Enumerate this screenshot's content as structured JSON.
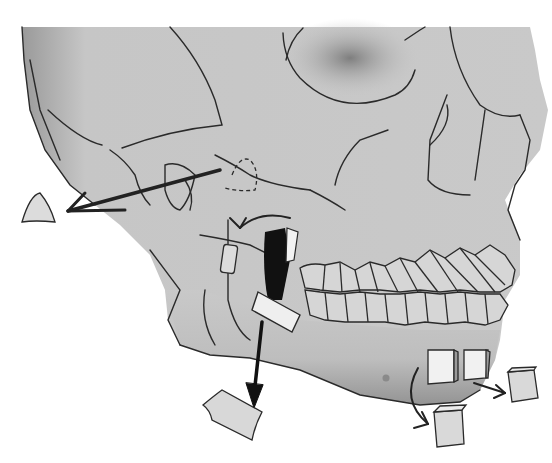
{
  "figure": {
    "title": "",
    "colors": {
      "bone": "#c9c9c9",
      "bone_shadow": "#8f8f8f",
      "outline": "#2a2a2a",
      "graft_block": "#dedede",
      "arrow": "#222222",
      "background": "#ffffff"
    },
    "elements": [
      {
        "name": "skull",
        "type": "illustration"
      },
      {
        "name": "zygomatic-graft-arrow",
        "type": "arrow"
      },
      {
        "name": "zygomatic-graft-piece",
        "type": "graft"
      },
      {
        "name": "coronoid-graft-arrow",
        "type": "arrow"
      },
      {
        "name": "ramus-graft-block",
        "type": "graft"
      },
      {
        "name": "ramus-graft-arrow",
        "type": "arrow"
      },
      {
        "name": "ramus-graft-piece",
        "type": "graft"
      },
      {
        "name": "chin-graft-blocks",
        "type": "graft"
      },
      {
        "name": "chin-graft-arrows",
        "type": "arrow"
      }
    ]
  }
}
